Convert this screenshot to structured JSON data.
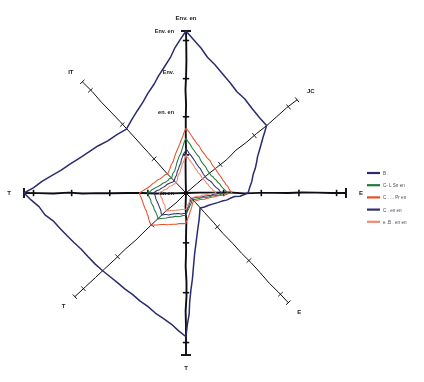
{
  "chart_data": {
    "type": "radar",
    "title": "",
    "grid": false,
    "legend_position": "right",
    "center": {
      "x": 186,
      "y": 193
    },
    "max_radius": 165,
    "axis_max": 4,
    "axes": [
      {
        "label": "Env. en",
        "angle_deg": 90,
        "length": 162,
        "ticks": 4
      },
      {
        "label": "JC",
        "angle_deg": 40,
        "length": 145,
        "ticks": 3
      },
      {
        "label": "E",
        "angle_deg": 0,
        "length": 160,
        "ticks": 4
      },
      {
        "label": "E",
        "angle_deg": -47,
        "length": 150,
        "ticks": 3
      },
      {
        "label": "T",
        "angle_deg": -90,
        "length": 162,
        "ticks": 3
      },
      {
        "label": "T",
        "angle_deg": -137,
        "length": 152,
        "ticks": 3
      },
      {
        "label": "T",
        "angle_deg": 180,
        "length": 162,
        "ticks": 4
      },
      {
        "label": "IT",
        "angle_deg": 133,
        "length": 152,
        "ticks": 3
      }
    ],
    "axis_tick_labels": [
      {
        "text": "Env. en",
        "value": 4
      },
      {
        "text": "Env.",
        "value": 3
      },
      {
        "text": "en. en",
        "value": 2
      },
      {
        "text": "en en",
        "value": 0
      }
    ],
    "series": [
      {
        "name": "B .",
        "color": "#2b2b6e",
        "values": [
          4.0,
          2.9,
          1.55,
          0.55,
          3.55,
          3.0,
          4.0,
          2.3
        ]
      },
      {
        "name": "C- L Sn en",
        "color": "#1d7a3a",
        "values": [
          1.35,
          0.85,
          1.05,
          0.25,
          0.55,
          1.0,
          0.95,
          0.55
        ]
      },
      {
        "name": "C . ... Pr en",
        "color": "#e8502a",
        "values": [
          1.6,
          1.05,
          1.15,
          0.3,
          0.75,
          1.25,
          1.15,
          0.7
        ]
      },
      {
        "name": "C . en en",
        "color": "#31316b",
        "values": [
          1.1,
          0.7,
          0.9,
          0.2,
          0.5,
          0.85,
          0.8,
          0.45
        ]
      },
      {
        "name": "e .B . en en",
        "color": "#f08a72",
        "values": [
          0.95,
          0.6,
          0.75,
          0.18,
          0.4,
          0.7,
          0.65,
          0.38
        ]
      }
    ]
  },
  "legend": {
    "items": [
      {
        "label": "B .",
        "color": "#2b2b6e"
      },
      {
        "label": "C- L Sn en",
        "color": "#1d7a3a"
      },
      {
        "label": "C . ... Pr en",
        "color": "#e8502a"
      },
      {
        "label": "C . en en",
        "color": "#31316b"
      },
      {
        "label": "e .B . en en",
        "color": "#f08a72"
      }
    ]
  }
}
